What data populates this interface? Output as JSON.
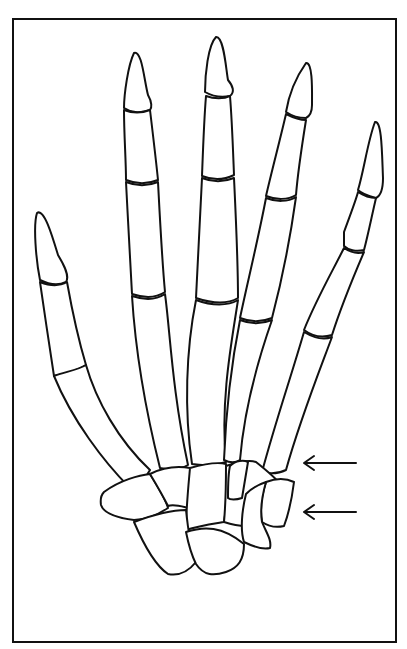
{
  "figure": {
    "frame": {
      "x": 13,
      "y": 19,
      "width": 383,
      "height": 623
    },
    "colors": {
      "stroke": "#111111",
      "background": "#ffffff"
    },
    "annotations": [
      {
        "type": "arrow",
        "direction": "left",
        "label": "",
        "y": 463
      },
      {
        "type": "arrow",
        "direction": "left",
        "label": "",
        "y": 512
      }
    ],
    "digits": [
      "thumb",
      "index",
      "middle",
      "ring",
      "little"
    ]
  }
}
